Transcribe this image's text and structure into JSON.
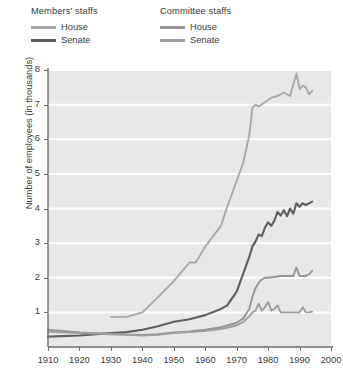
{
  "legend": {
    "groups": [
      {
        "title": "Members' staffs",
        "entries": [
          {
            "label": "House",
            "color": "#a8a8a8"
          },
          {
            "label": "Senate",
            "color": "#5e5e5e"
          }
        ]
      },
      {
        "title": "Committee staffs",
        "entries": [
          {
            "label": "House",
            "color": "#949494"
          },
          {
            "label": "Senate",
            "color": "#9e9e9e"
          }
        ]
      }
    ]
  },
  "chart_data": {
    "type": "line",
    "title": "",
    "xlabel": "",
    "ylabel": "Number of employees (in thousands)",
    "xlim": [
      1910,
      2000
    ],
    "ylim": [
      0,
      8
    ],
    "xticks": [
      1910,
      1920,
      1930,
      1940,
      1950,
      1960,
      1970,
      1980,
      1990,
      2000
    ],
    "yticks": [
      1,
      2,
      3,
      4,
      5,
      6,
      7,
      8
    ],
    "grid": "horizontal-white",
    "legend_position": "above-plot",
    "plot_background": "#e8e8e8",
    "series": [
      {
        "name": "Members' staffs — House",
        "group": "Members' staffs",
        "chamber": "House",
        "color": "#a8a8a8",
        "points": [
          [
            1930,
            0.87
          ],
          [
            1935,
            0.87
          ],
          [
            1940,
            1.0
          ],
          [
            1945,
            1.44
          ],
          [
            1950,
            1.9
          ],
          [
            1955,
            2.44
          ],
          [
            1957,
            2.44
          ],
          [
            1960,
            2.9
          ],
          [
            1965,
            3.5
          ],
          [
            1967,
            4.05
          ],
          [
            1970,
            4.8
          ],
          [
            1972,
            5.3
          ],
          [
            1974,
            6.1
          ],
          [
            1975,
            6.9
          ],
          [
            1976,
            7.0
          ],
          [
            1977,
            6.95
          ],
          [
            1979,
            7.07
          ],
          [
            1981,
            7.2
          ],
          [
            1983,
            7.25
          ],
          [
            1985,
            7.35
          ],
          [
            1987,
            7.25
          ],
          [
            1989,
            7.9
          ],
          [
            1990,
            7.45
          ],
          [
            1991,
            7.55
          ],
          [
            1992,
            7.5
          ],
          [
            1993,
            7.3
          ],
          [
            1994,
            7.4
          ]
        ]
      },
      {
        "name": "Members' staffs — Senate",
        "group": "Members' staffs",
        "chamber": "Senate",
        "color": "#5e5e5e",
        "points": [
          [
            1910,
            0.3
          ],
          [
            1920,
            0.33
          ],
          [
            1930,
            0.4
          ],
          [
            1935,
            0.43
          ],
          [
            1940,
            0.5
          ],
          [
            1945,
            0.6
          ],
          [
            1950,
            0.73
          ],
          [
            1955,
            0.8
          ],
          [
            1960,
            0.92
          ],
          [
            1965,
            1.1
          ],
          [
            1967,
            1.2
          ],
          [
            1970,
            1.6
          ],
          [
            1972,
            2.1
          ],
          [
            1974,
            2.6
          ],
          [
            1975,
            2.9
          ],
          [
            1976,
            3.05
          ],
          [
            1977,
            3.25
          ],
          [
            1978,
            3.2
          ],
          [
            1979,
            3.45
          ],
          [
            1980,
            3.6
          ],
          [
            1981,
            3.5
          ],
          [
            1982,
            3.65
          ],
          [
            1983,
            3.9
          ],
          [
            1984,
            3.8
          ],
          [
            1985,
            3.95
          ],
          [
            1986,
            3.78
          ],
          [
            1987,
            4.0
          ],
          [
            1988,
            3.85
          ],
          [
            1989,
            4.15
          ],
          [
            1990,
            4.05
          ],
          [
            1991,
            4.15
          ],
          [
            1992,
            4.1
          ],
          [
            1993,
            4.15
          ],
          [
            1994,
            4.2
          ]
        ]
      },
      {
        "name": "Committee staffs — House",
        "group": "Committee staffs",
        "chamber": "House",
        "color": "#949494",
        "points": [
          [
            1910,
            0.5
          ],
          [
            1920,
            0.42
          ],
          [
            1930,
            0.38
          ],
          [
            1935,
            0.36
          ],
          [
            1940,
            0.35
          ],
          [
            1945,
            0.37
          ],
          [
            1950,
            0.42
          ],
          [
            1955,
            0.45
          ],
          [
            1960,
            0.5
          ],
          [
            1965,
            0.57
          ],
          [
            1970,
            0.7
          ],
          [
            1972,
            0.82
          ],
          [
            1974,
            1.1
          ],
          [
            1975,
            1.45
          ],
          [
            1976,
            1.7
          ],
          [
            1977,
            1.85
          ],
          [
            1978,
            1.95
          ],
          [
            1979,
            2.0
          ],
          [
            1980,
            2.0
          ],
          [
            1982,
            2.02
          ],
          [
            1984,
            2.05
          ],
          [
            1986,
            2.05
          ],
          [
            1988,
            2.05
          ],
          [
            1989,
            2.3
          ],
          [
            1990,
            2.05
          ],
          [
            1992,
            2.05
          ],
          [
            1993,
            2.1
          ],
          [
            1994,
            2.2
          ]
        ]
      },
      {
        "name": "Committee staffs — Senate",
        "group": "Committee staffs",
        "chamber": "Senate",
        "color": "#9e9e9e",
        "points": [
          [
            1910,
            0.44
          ],
          [
            1920,
            0.4
          ],
          [
            1930,
            0.37
          ],
          [
            1935,
            0.35
          ],
          [
            1940,
            0.33
          ],
          [
            1945,
            0.35
          ],
          [
            1950,
            0.4
          ],
          [
            1955,
            0.43
          ],
          [
            1960,
            0.47
          ],
          [
            1965,
            0.52
          ],
          [
            1970,
            0.62
          ],
          [
            1972,
            0.72
          ],
          [
            1974,
            0.88
          ],
          [
            1975,
            1.0
          ],
          [
            1976,
            1.05
          ],
          [
            1977,
            1.25
          ],
          [
            1978,
            1.05
          ],
          [
            1979,
            1.15
          ],
          [
            1980,
            1.3
          ],
          [
            1981,
            1.05
          ],
          [
            1982,
            1.1
          ],
          [
            1983,
            1.2
          ],
          [
            1984,
            1.0
          ],
          [
            1985,
            1.0
          ],
          [
            1986,
            1.0
          ],
          [
            1988,
            1.0
          ],
          [
            1990,
            1.0
          ],
          [
            1991,
            1.15
          ],
          [
            1992,
            1.0
          ],
          [
            1993,
            1.0
          ],
          [
            1994,
            1.02
          ]
        ]
      }
    ]
  }
}
